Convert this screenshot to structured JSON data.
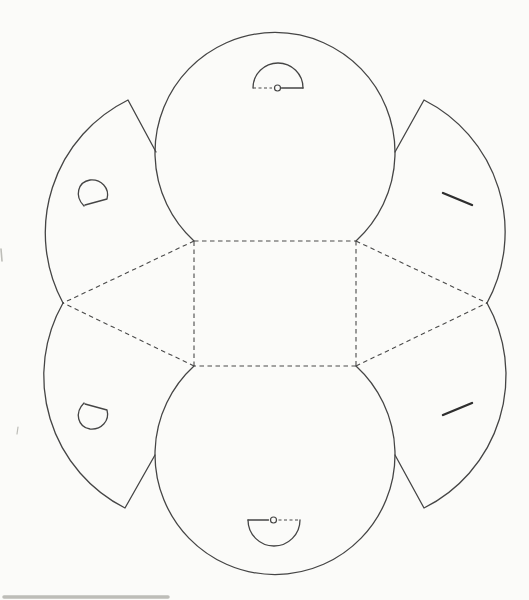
{
  "canvas": {
    "width": 529,
    "height": 600,
    "background": "#fbfbf9"
  },
  "template": {
    "name": "round-pouch-papercraft-cutting-template",
    "stroke_color": "#454545",
    "fold_color": "#4a4a4a",
    "artifact_color": "#bdbdb8",
    "cut_line_width": 1.3,
    "fold_line_width": 1.1,
    "slit_width": 2.4,
    "fold_dash": "4.5 3.5",
    "tab_dash": "3 2.5",
    "cut_lines": [
      {
        "name": "top-circle-panel-outline",
        "d": "M 194 241 A 120 120 0 1 1 356 241"
      },
      {
        "name": "bottom-circle-panel-outline",
        "d": "M 356 366 A 120 120 0 1 1 194 366"
      },
      {
        "name": "upper-left-flap-outline",
        "d": "M 63 303 A 148 148 0 0 1 128 100 L 156 152"
      },
      {
        "name": "lower-left-flap-outline",
        "d": "M 63 303 A 148 148 0 0 0 125 508 L 155 455"
      },
      {
        "name": "upper-right-flap-outline",
        "d": "M 487 303 A 148 148 0 0 0 424 100 L 395 152"
      },
      {
        "name": "lower-right-flap-outline",
        "d": "M 487 303 A 148 148 0 0 1 424 508 L 395 455"
      },
      {
        "name": "top-closure-tab-dome",
        "d": "M 253 88 A 25 25 0 0 1 303 88"
      },
      {
        "name": "top-closure-tab-base-solid",
        "d": "M 281.5 88 L 303 88"
      },
      {
        "name": "bottom-closure-tab-dome",
        "d": "M 248 520 A 26 26 0 0 0 300 520"
      },
      {
        "name": "bottom-closure-tab-base-solid",
        "d": "M 248 520 L 268.5 520"
      },
      {
        "name": "upper-left-buttonhole-cut",
        "d": "M 84 206 C 74 196 78 182 90 180 C 101 179 110 188 107 199 L 85 205"
      },
      {
        "name": "lower-left-buttonhole-cut",
        "d": "M 84 403 C 74 413 78 427 90 429 C 101 430 110 421 107 410 L 85 404"
      }
    ],
    "fold_lines": [
      {
        "name": "base-rect-top-fold",
        "d": "M 194 241 L 356 241",
        "dash": "fold"
      },
      {
        "name": "base-rect-right-fold",
        "d": "M 356 241 L 356 366",
        "dash": "fold"
      },
      {
        "name": "base-rect-bottom-fold",
        "d": "M 356 366 L 194 366",
        "dash": "fold"
      },
      {
        "name": "base-rect-left-fold",
        "d": "M 194 366 L 194 241",
        "dash": "fold"
      },
      {
        "name": "upper-left-diagonal-fold",
        "d": "M 194 241 L 63 303",
        "dash": "fold"
      },
      {
        "name": "lower-left-diagonal-fold",
        "d": "M 194 366 L 63 303",
        "dash": "fold"
      },
      {
        "name": "upper-right-diagonal-fold",
        "d": "M 356 241 L 487 303",
        "dash": "fold"
      },
      {
        "name": "lower-right-diagonal-fold",
        "d": "M 356 366 L 487 303",
        "dash": "fold"
      },
      {
        "name": "top-tab-base-fold",
        "d": "M 253 88 L 272 88",
        "dash": "tab"
      },
      {
        "name": "bottom-tab-base-fold",
        "d": "M 278.5 520 L 300 520",
        "dash": "tab"
      }
    ],
    "slits": [
      {
        "name": "upper-right-button-slit",
        "d": "M 443 193 L 472 205"
      },
      {
        "name": "lower-right-button-slit",
        "d": "M 443 415 L 472 403"
      }
    ],
    "eyelets": [
      {
        "name": "top-tab-eyelet",
        "cx": 277.5,
        "cy": 88,
        "r": 3
      },
      {
        "name": "bottom-tab-eyelet",
        "cx": 273.5,
        "cy": 520,
        "r": 3
      }
    ],
    "artifacts": [
      {
        "name": "scan-speck-left-edge",
        "d": "M 1 249 L 2 261",
        "width": 1.6
      },
      {
        "name": "scan-tick-mark",
        "d": "M 18 427 L 17 434",
        "width": 1.2
      },
      {
        "name": "scan-smudge-bottom",
        "d": "M 4 597 L 168 597",
        "width": 3.5
      }
    ]
  }
}
